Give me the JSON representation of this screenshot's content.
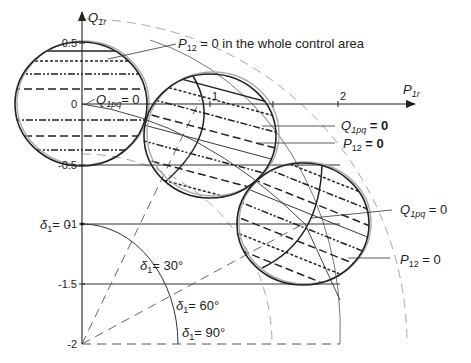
{
  "axes": {
    "y_label": "Q",
    "y_label_sub": "1r",
    "x_label": "P",
    "x_label_sub": "1r",
    "y_ticks": [
      "0.5",
      "0",
      "-0.5",
      "-1",
      "-1.5",
      "-2"
    ],
    "x_ticks": [
      "1",
      "2"
    ]
  },
  "annotations": {
    "top": {
      "p": "P",
      "sub": "12",
      "rest": " = 0 in the whole control area"
    },
    "origin_q": {
      "q": "Q",
      "sub": "1pq",
      "rest": "= 0"
    },
    "circle2_q": {
      "q": "Q",
      "sub": "1pq",
      "rest": " = 0"
    },
    "circle2_p": {
      "p": "P",
      "sub": "12",
      "rest": " = 0"
    },
    "circle3_q": {
      "q": "Q",
      "sub": "1pq",
      "rest": " = 0"
    },
    "circle3_p": {
      "p": "P",
      "sub": "12",
      "rest": " = 0"
    }
  },
  "angles": [
    {
      "sym": "δ",
      "sub": "1",
      "rest": "= 0"
    },
    {
      "sym": "δ",
      "sub": "1",
      "rest": "= 30°"
    },
    {
      "sym": "δ",
      "sub": "1",
      "rest": "= 60°"
    },
    {
      "sym": "δ",
      "sub": "1",
      "rest": "= 90°"
    }
  ],
  "colors": {
    "ink": "#222222",
    "gray": "#9a9a9a"
  }
}
